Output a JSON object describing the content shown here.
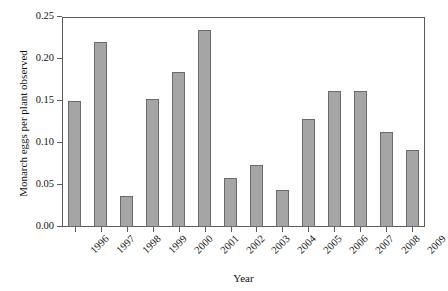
{
  "chart_data": {
    "type": "bar",
    "title": "",
    "xlabel": "Year",
    "ylabel": "Monarch eggs per plant observed",
    "categories": [
      "1996",
      "1997",
      "1998",
      "1999",
      "2000",
      "2001",
      "2002",
      "2003",
      "2004",
      "2005",
      "2006",
      "2007",
      "2008",
      "2009"
    ],
    "values": [
      0.15,
      0.22,
      0.037,
      0.152,
      0.184,
      0.235,
      0.058,
      0.074,
      0.044,
      0.129,
      0.162,
      0.162,
      0.113,
      0.092
    ],
    "ylim": [
      0.0,
      0.25
    ],
    "ytick_values": [
      0.0,
      0.05,
      0.1,
      0.15,
      0.2,
      0.25
    ],
    "ytick_labels": [
      "0.00",
      "0.05",
      "0.10",
      "0.15",
      "0.20",
      "0.25"
    ],
    "grid": false,
    "legend": null,
    "bar_color": "#a5a5a5",
    "bar_edge_color": "#6a6a6a",
    "axis_color": "#5b5b5b",
    "background": "#ffffff"
  }
}
